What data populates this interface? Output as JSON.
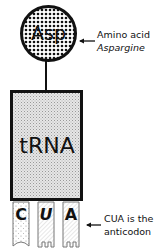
{
  "diagram": {
    "amino_acid": {
      "abbrev": "Asp",
      "label_line1": "Amino acid",
      "label_line2": "Aspargine"
    },
    "trna": {
      "label": "tRNA"
    },
    "anticodon": {
      "bases": [
        {
          "letter": "C",
          "style": "stippled"
        },
        {
          "letter": "U",
          "style": "striped",
          "italic": true
        },
        {
          "letter": "A",
          "style": "striped"
        }
      ],
      "label_line1": "CUA is the",
      "label_line2": "anticodon"
    },
    "colors": {
      "stroke": "#111111",
      "fill_light": "#e4e4e4",
      "background": "#ffffff"
    }
  }
}
